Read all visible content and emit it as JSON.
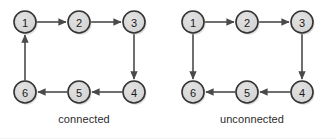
{
  "figure": {
    "width": 336,
    "height": 139,
    "background": "#ffffff"
  },
  "style": {
    "node_fill": "#d2d2d2",
    "node_fill_highlight": "#e2e2e2",
    "node_stroke": "#333333",
    "node_radius": 11,
    "node_stroke_width": 1.6,
    "edge_color": "#4a4a4a",
    "edge_width": 1.6,
    "label_color": "#1a1a1a",
    "caption_color": "#2b2b2b",
    "shadow_color": "#bfbfbf"
  },
  "graphs": [
    {
      "id": "connected",
      "caption": "connected",
      "nodes": [
        {
          "id": "1",
          "label": "1",
          "x": 25,
          "y": 22
        },
        {
          "id": "2",
          "label": "2",
          "x": 79,
          "y": 22
        },
        {
          "id": "3",
          "label": "3",
          "x": 134,
          "y": 22
        },
        {
          "id": "4",
          "label": "4",
          "x": 134,
          "y": 92
        },
        {
          "id": "5",
          "label": "5",
          "x": 79,
          "y": 92
        },
        {
          "id": "6",
          "label": "6",
          "x": 25,
          "y": 92
        }
      ],
      "edges": [
        {
          "from": "1",
          "to": "2",
          "direction": "right"
        },
        {
          "from": "2",
          "to": "3",
          "direction": "right"
        },
        {
          "from": "3",
          "to": "4",
          "direction": "down"
        },
        {
          "from": "4",
          "to": "5",
          "direction": "left"
        },
        {
          "from": "5",
          "to": "6",
          "direction": "left"
        },
        {
          "from": "6",
          "to": "1",
          "direction": "up"
        }
      ]
    },
    {
      "id": "unconnected",
      "caption": "unconnected",
      "nodes": [
        {
          "id": "1",
          "label": "1",
          "x": 25,
          "y": 22
        },
        {
          "id": "2",
          "label": "2",
          "x": 79,
          "y": 22
        },
        {
          "id": "3",
          "label": "3",
          "x": 134,
          "y": 22
        },
        {
          "id": "4",
          "label": "4",
          "x": 134,
          "y": 92
        },
        {
          "id": "5",
          "label": "5",
          "x": 79,
          "y": 92
        },
        {
          "id": "6",
          "label": "6",
          "x": 25,
          "y": 92
        }
      ],
      "edges": [
        {
          "from": "1",
          "to": "2",
          "direction": "right"
        },
        {
          "from": "2",
          "to": "3",
          "direction": "right"
        },
        {
          "from": "3",
          "to": "4",
          "direction": "down"
        },
        {
          "from": "4",
          "to": "5",
          "direction": "left"
        },
        {
          "from": "5",
          "to": "6",
          "direction": "left"
        },
        {
          "from": "1",
          "to": "6",
          "direction": "down"
        }
      ]
    }
  ]
}
